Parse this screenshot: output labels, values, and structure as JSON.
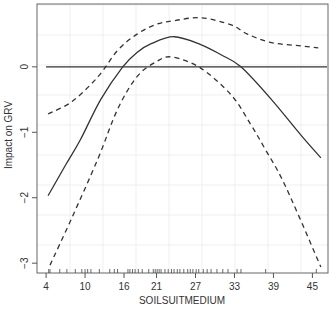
{
  "chart_data": {
    "type": "line",
    "title": "",
    "xlabel": "SOILSUITMEDIUM",
    "ylabel": "Impact on GRV",
    "xlim": [
      2.6,
      47.4
    ],
    "ylim": [
      -3.15,
      0.96
    ],
    "x_ticks": [
      4,
      10,
      16,
      21,
      27,
      33,
      39,
      45
    ],
    "y_ticks": [
      0,
      -1,
      -2,
      -3
    ],
    "grid": true,
    "legend": null,
    "reference_line": {
      "y": 0,
      "style": "solid"
    },
    "series": [
      {
        "name": "fit",
        "style": "solid",
        "x": [
          4.3,
          7.0,
          9.3,
          12.4,
          15.8,
          18.0,
          20.1,
          23.7,
          27.8,
          31.0,
          34.0,
          38.7,
          43.3,
          46.3
        ],
        "values": [
          -1.97,
          -1.5,
          -1.11,
          -0.5,
          0.0,
          0.22,
          0.35,
          0.46,
          0.34,
          0.18,
          0.0,
          -0.5,
          -1.05,
          -1.39
        ]
      },
      {
        "name": "upper band",
        "style": "dashed",
        "x": [
          4.3,
          8.0,
          12.0,
          15.0,
          18.0,
          21.0,
          24.0,
          27.9,
          32.5,
          35.0,
          38.7,
          43.3,
          45.9
        ],
        "values": [
          -0.72,
          -0.53,
          -0.15,
          0.25,
          0.5,
          0.65,
          0.71,
          0.75,
          0.64,
          0.5,
          0.37,
          0.32,
          0.29
        ]
      },
      {
        "name": "lower band",
        "style": "dashed",
        "x": [
          4.6,
          8.0,
          12.0,
          15.0,
          18.0,
          21.0,
          23.4,
          27.8,
          32.5,
          35.5,
          37.8,
          40.2,
          43.0,
          46.3
        ],
        "values": [
          -3.03,
          -2.3,
          -1.4,
          -0.65,
          -0.15,
          0.08,
          0.15,
          -0.02,
          -0.43,
          -0.88,
          -1.27,
          -1.69,
          -2.3,
          -3.06
        ]
      }
    ],
    "rug_x": [
      4.4,
      4.6,
      6.1,
      7.2,
      8.5,
      9.5,
      10.0,
      10.4,
      10.9,
      12.2,
      13.8,
      14.5,
      15.0,
      16.6,
      16.9,
      17.3,
      17.7,
      18.2,
      18.8,
      19.8,
      20.5,
      20.8,
      21.1,
      21.4,
      21.7,
      22.3,
      22.8,
      23.3,
      23.7,
      24.2,
      24.6,
      25.2,
      25.8,
      26.2,
      26.6,
      27.1,
      27.5,
      28.2,
      28.8,
      29.4,
      30.3,
      31.2,
      32.0,
      33.4,
      34.0,
      37.8,
      45.6
    ]
  }
}
